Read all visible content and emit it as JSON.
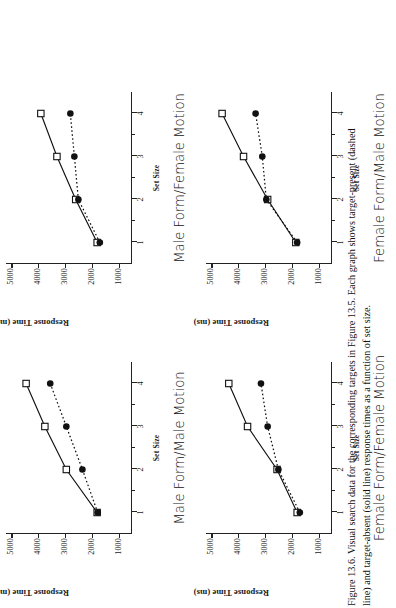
{
  "figure": {
    "caption_lines": [
      "Figure 13.6.  Visual search data for the corresponding targets in Figure 13.5.  Each graph shows target-present (dashed",
      "line) and target-absent (solid line) response times as a function of set size."
    ]
  },
  "axes": {
    "ylabel": "Response Time (ms)",
    "xlabel": "Set Size",
    "yticks": [
      "1000",
      "2000",
      "3000",
      "4000",
      "5000"
    ],
    "xticks": [
      "1",
      "2",
      "3",
      "4"
    ]
  },
  "chart_data": {
    "type": "line",
    "title": "Figure 13.6. Visual search data",
    "xlabel": "Set Size",
    "ylabel": "Response Time (ms)",
    "x": [
      1,
      2,
      3,
      4
    ],
    "xlim": [
      0.5,
      4.5
    ],
    "ylim": [
      500,
      5200
    ],
    "ytick_values": [
      1000,
      2000,
      3000,
      4000,
      5000
    ],
    "grid": false,
    "legend": "none",
    "legend_entries": [
      {
        "name": "target-absent",
        "line": "solid",
        "marker": "open-square"
      },
      {
        "name": "target-present",
        "line": "dashed",
        "marker": "filled-circle"
      }
    ],
    "panels": [
      {
        "id": "male-form-male-motion",
        "title": "Male Form/Male Motion",
        "series": [
          {
            "name": "target-absent",
            "line": "solid",
            "marker": "open-square",
            "values": [
              1800,
              2950,
              3750,
              4450
            ]
          },
          {
            "name": "target-present",
            "line": "dashed",
            "marker": "filled-circle",
            "values": [
              1780,
              2350,
              2950,
              3550
            ]
          }
        ]
      },
      {
        "id": "male-form-female-motion",
        "title": "Male Form/Female Motion",
        "series": [
          {
            "name": "target-absent",
            "line": "solid",
            "marker": "open-square",
            "values": [
              1800,
              2600,
              3300,
              3900
            ]
          },
          {
            "name": "target-present",
            "line": "dashed",
            "marker": "filled-circle",
            "values": [
              1700,
              2500,
              2650,
              2800
            ]
          }
        ]
      },
      {
        "id": "female-form-female-motion",
        "title": "Female Form/Female Motion",
        "series": [
          {
            "name": "target-absent",
            "line": "solid",
            "marker": "open-square",
            "values": [
              1800,
              2550,
              3650,
              4350
            ]
          },
          {
            "name": "target-present",
            "line": "dashed",
            "marker": "filled-circle",
            "values": [
              1700,
              2500,
              2900,
              3150
            ]
          }
        ]
      },
      {
        "id": "female-form-male-motion",
        "title": "Female Form/Male Motion",
        "series": [
          {
            "name": "target-absent",
            "line": "solid",
            "marker": "open-square",
            "values": [
              1850,
              2900,
              3800,
              4600
            ]
          },
          {
            "name": "target-present",
            "line": "dashed",
            "marker": "filled-circle",
            "values": [
              1800,
              2950,
              3100,
              3350
            ]
          }
        ]
      }
    ]
  }
}
